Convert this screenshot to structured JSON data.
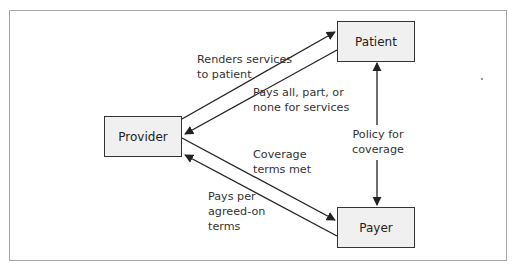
{
  "diagram": {
    "nodes": {
      "provider": "Provider",
      "patient": "Patient",
      "payer": "Payer"
    },
    "edges": [
      {
        "from": "provider",
        "to": "patient",
        "label_lines": [
          "Renders services",
          "to patient"
        ]
      },
      {
        "from": "patient",
        "to": "provider",
        "label_lines": [
          "Pays all, part, or",
          "none for services"
        ]
      },
      {
        "from": "provider",
        "to": "payer",
        "label_lines": [
          "Coverage",
          "terms met"
        ]
      },
      {
        "from": "payer",
        "to": "provider",
        "label_lines": [
          "Pays per",
          "agreed-on",
          "terms"
        ]
      },
      {
        "from": "patient",
        "to": "payer",
        "bidirectional": true,
        "label_lines": [
          "Policy for",
          "coverage"
        ]
      }
    ],
    "colors": {
      "box_fill": "#f0f0f0",
      "box_border": "#333333",
      "arrow": "#222222",
      "frame_border": "#a8a8a8"
    }
  }
}
